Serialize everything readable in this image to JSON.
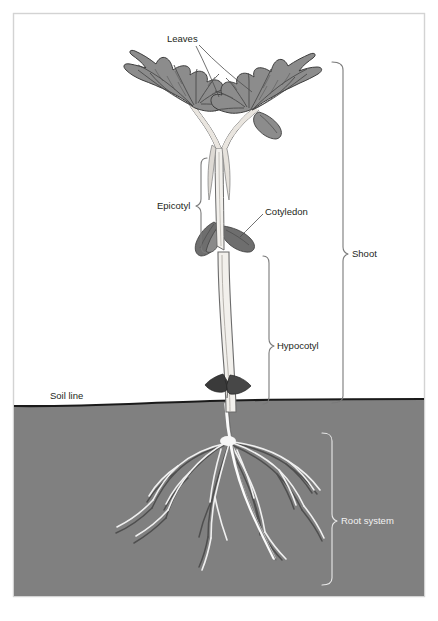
{
  "figure": {
    "frame": {
      "border_color": "#d3d3d3",
      "background_color": "#ffffff"
    }
  },
  "colors": {
    "soil": "#808080",
    "soil_line": "#1a1a1a",
    "leaf_fill": "#8c8c8c",
    "leaf_outline": "#3d3d3d",
    "leaf_vein": "#4a4a4a",
    "cotyledon_fill": "#6e6e6e",
    "stem_fill": "#f2f0ec",
    "stem_outline": "#6b6b6b",
    "root_light": "#f5f5f5",
    "root_dark": "#4f4f4f",
    "label_text": "#231f20",
    "label_text_light": "#f2f2f2",
    "leader_line": "#4d4d4d",
    "bracket_dark": "#7a7a7a",
    "bracket_light": "#e8e8e8"
  },
  "labels": {
    "leaves": {
      "text": "Leaves",
      "x": 167,
      "y": 42,
      "anchor": "start",
      "style": "dark"
    },
    "epicotyl": {
      "text": "Epicotyl",
      "x": 157,
      "y": 208,
      "anchor": "start",
      "style": "dark"
    },
    "cotyledon": {
      "text": "Cotyledon",
      "x": 265,
      "y": 215,
      "anchor": "start",
      "style": "dark"
    },
    "hypocotyl": {
      "text": "Hypocotyl",
      "x": 276,
      "y": 348,
      "anchor": "start",
      "style": "dark"
    },
    "soil_line": {
      "text": "Soil line",
      "x": 50,
      "y": 399,
      "anchor": "start",
      "style": "dark"
    },
    "shoot": {
      "text": "Shoot",
      "x": 352,
      "y": 256,
      "anchor": "start",
      "style": "dark"
    },
    "root_system": {
      "text": "Root system",
      "x": 342,
      "y": 523,
      "anchor": "start",
      "style": "light"
    }
  },
  "brackets": {
    "epicotyl": {
      "x": 201,
      "top": 158,
      "bottom": 253,
      "tip_y": 206,
      "direction": "left",
      "style": "dark"
    },
    "hypocotyl": {
      "x": 270,
      "top": 256,
      "bottom": 404,
      "tip_y": 346,
      "direction": "right",
      "style": "dark"
    },
    "shoot": {
      "x": 344,
      "top": 62,
      "bottom": 403,
      "tip_y": 254,
      "direction": "right",
      "style": "dark"
    },
    "root_system": {
      "x": 333,
      "top": 433,
      "bottom": 585,
      "tip_y": 521,
      "direction": "right",
      "style": "light"
    }
  },
  "soil": {
    "top_y_left": 405,
    "top_y_right": 399,
    "bottom_y": 596,
    "left_x": 14,
    "right_x": 424
  },
  "plant_parts": [
    {
      "name": "left-leaf",
      "description": "large lobed leaf, upper left"
    },
    {
      "name": "right-leaf",
      "description": "large lobed leaf, upper right"
    },
    {
      "name": "petioles",
      "description": "two leaf stalks converging"
    },
    {
      "name": "epicotyl-stem",
      "description": "pale stem above cotyledons"
    },
    {
      "name": "cotyledon-left",
      "description": "small dark seed leaf pointing left"
    },
    {
      "name": "cotyledon-right",
      "description": "small dark seed leaf pointing right"
    },
    {
      "name": "hypocotyl-stem",
      "description": "pale stem below cotyledons to soil"
    },
    {
      "name": "scale-leaf",
      "description": "dark remnant structure on lower hypocotyl"
    },
    {
      "name": "taproot",
      "description": "main white root descending"
    },
    {
      "name": "lateral-roots",
      "description": "branching fibrous roots"
    }
  ]
}
